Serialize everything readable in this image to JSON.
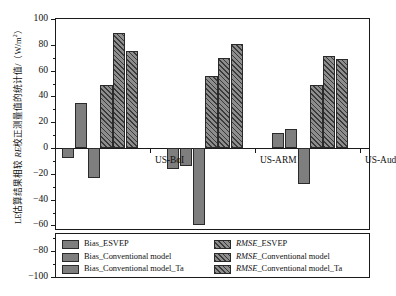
{
  "axes": {
    "y_label_pre": "LE估算结果相较 ",
    "y_label_it": "RE",
    "y_label_post": "校正测量值的统计值/（W/m",
    "y_label_sup": "2",
    "y_label_end": "）",
    "y_ticks": [
      "100",
      "80",
      "60",
      "40",
      "20",
      "0",
      "-20",
      "-40",
      "-60",
      "-80",
      "-100"
    ],
    "y_min": -100,
    "y_max": 100
  },
  "groups": [
    "US-BoI",
    "US-ARM",
    "US-Aud"
  ],
  "legend": {
    "left": [
      {
        "label": "Bias_ESVEP",
        "style": "solid",
        "italic_prefix": ""
      },
      {
        "label": "Bias_Conventional model",
        "style": "solid",
        "italic_prefix": ""
      },
      {
        "label": "Bias_Conventional model_Ta",
        "style": "solid",
        "italic_prefix": ""
      }
    ],
    "right": [
      {
        "italic_prefix": "RMSE",
        "label": "_ESVEP",
        "style": "hatch"
      },
      {
        "italic_prefix": "RMSE",
        "label": "_Conventional model",
        "style": "hatch"
      },
      {
        "italic_prefix": "RMSE",
        "label": "_Conventional model_Ta",
        "style": "hatch"
      }
    ]
  },
  "chart_data": {
    "type": "bar",
    "title": "",
    "xlabel": "",
    "ylabel": "LE估算结果相较 RE校正测量值的统计值/（W/m2）",
    "ylim": [
      -100,
      100
    ],
    "ytick_step": 20,
    "grid": false,
    "legend_position": "below-plot",
    "categories": [
      "US-BoI",
      "US-ARM",
      "US-Aud"
    ],
    "series": [
      {
        "name": "Bias_ESVEP",
        "style": "solid",
        "values": [
          -8,
          -16,
          12
        ]
      },
      {
        "name": "Bias_Conventional model",
        "style": "solid",
        "values": [
          35,
          -14,
          15
        ]
      },
      {
        "name": "Bias_Conventional model_Ta",
        "style": "solid",
        "values": [
          -23,
          -60,
          -28
        ]
      },
      {
        "name": "RMSE_ESVEP",
        "style": "hatch",
        "values": [
          49,
          56,
          49
        ]
      },
      {
        "name": "RMSE_Conventional model",
        "style": "hatch",
        "values": [
          89,
          70,
          71
        ]
      },
      {
        "name": "RMSE_Conventional model_Ta",
        "style": "hatch",
        "values": [
          75,
          81,
          69
        ]
      }
    ],
    "units": "W/m2"
  }
}
